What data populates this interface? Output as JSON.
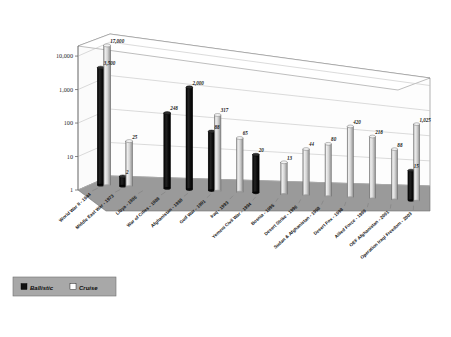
{
  "chart_data": {
    "type": "bar",
    "title": "",
    "subtitle": "",
    "xlabel": "",
    "ylabel": "",
    "scale": "log",
    "ylim": [
      1,
      20000
    ],
    "ytick_labels": [
      "1",
      "10",
      "100",
      "1,000",
      "10,000"
    ],
    "ytick_values": [
      1,
      10,
      100,
      1000,
      10000
    ],
    "grid": true,
    "legend_position": "bottom-left",
    "categories": [
      "World War II - 1944",
      "Middle East War - 1973",
      "Libya - 1986",
      "War of Cities - 1988",
      "Afghanistan - 1988",
      "Gulf War - 1991",
      "Iraq - 1993",
      "Yemeni Civil War - 1994",
      "Bosnia - 1995",
      "Desert Strike - 1996",
      "Sudan & Afghanistan - 1998",
      "Desert Fox - 1998",
      "Allied Force - 1999",
      "OEF Afghanistan - 2001",
      "Operation Iraqi Freedom - 2003"
    ],
    "series": [
      {
        "name": "Ballistic",
        "color": "#0d0d0d",
        "values": [
          3500,
          2,
          null,
          248,
          2000,
          88,
          null,
          20,
          null,
          null,
          null,
          null,
          null,
          null,
          15
        ],
        "labels": [
          "3,500",
          "2",
          "",
          "248",
          "2,000",
          "88",
          "",
          "20",
          "",
          "",
          "",
          "",
          "",
          "",
          "15"
        ]
      },
      {
        "name": "Cruise",
        "color": "#d8d8d8",
        "values": [
          17000,
          25,
          null,
          null,
          null,
          317,
          65,
          null,
          13,
          44,
          80,
          420,
          218,
          88,
          1025
        ],
        "labels": [
          "17,000",
          "25",
          "",
          "",
          "",
          "317",
          "65",
          "",
          "13",
          "44",
          "80",
          "420",
          "218",
          "88",
          "1,025"
        ]
      }
    ]
  },
  "legend": {
    "items": [
      {
        "label": "Ballistic",
        "swatch": "dark"
      },
      {
        "label": "Cruise",
        "swatch": "light"
      }
    ]
  },
  "colors": {
    "ballistic": "#0d0d0d",
    "cruise": "#d9d9d9",
    "floor": "#9a9a9a",
    "wall": "#fdfdfd",
    "legend_bg": "#a8a8a8",
    "grid": "#bdbdbd",
    "background": "#ffffff"
  }
}
